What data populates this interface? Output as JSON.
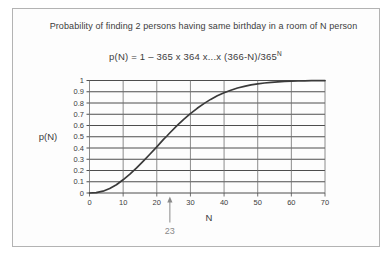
{
  "figure": {
    "title": "Probability of finding 2 persons having same birthday in a room of N person",
    "formula": {
      "main": "p(N) = 1 – 365 x 364 x...x (366-N)/365",
      "sup": "N"
    }
  },
  "chart_data": {
    "type": "line",
    "title": "Probability of finding 2 persons having same birthday in a room of N person",
    "subtitle": "p(N) = 1 – 365 x 364 x...x (366-N)/365^N",
    "xlabel": "N",
    "ylabel": "p(N)",
    "xlim": [
      0,
      70
    ],
    "ylim": [
      0,
      1
    ],
    "grid": true,
    "legend": "none",
    "x_ticks": [
      0,
      10,
      20,
      30,
      40,
      50,
      60,
      70
    ],
    "y_ticks": [
      0,
      0.1,
      0.2,
      0.3,
      0.4,
      0.5,
      0.6,
      0.7,
      0.8,
      0.9,
      1
    ],
    "y_tick_labels": [
      "0",
      "0.1",
      "0.2",
      "0.3",
      "0.4",
      "0.5",
      "0.6",
      "0.7",
      "0.8",
      "0.9",
      "1"
    ],
    "series": [
      {
        "name": "p(N)",
        "x": [
          0,
          2,
          4,
          6,
          8,
          10,
          12,
          14,
          16,
          18,
          20,
          22,
          23,
          24,
          26,
          28,
          30,
          32,
          34,
          36,
          38,
          40,
          42,
          44,
          46,
          48,
          50,
          52,
          54,
          56,
          58,
          60,
          62,
          64,
          66,
          68,
          70
        ],
        "y": [
          0,
          0.003,
          0.016,
          0.04,
          0.074,
          0.117,
          0.167,
          0.223,
          0.284,
          0.347,
          0.411,
          0.476,
          0.507,
          0.538,
          0.598,
          0.654,
          0.706,
          0.753,
          0.795,
          0.832,
          0.864,
          0.891,
          0.914,
          0.933,
          0.948,
          0.961,
          0.97,
          0.978,
          0.984,
          0.988,
          0.992,
          0.994,
          0.996,
          0.997,
          0.998,
          0.999,
          0.999
        ]
      }
    ],
    "annotation": {
      "label": "23",
      "x": 23
    },
    "colors": {
      "curve": "#3a3a3a",
      "h_grid": "#4d4d4d",
      "v_grid": "#6e6e6e",
      "text": "#3c3c3c",
      "annotation": "#8a8a8a",
      "frame_border": "#b3b3b3"
    }
  }
}
